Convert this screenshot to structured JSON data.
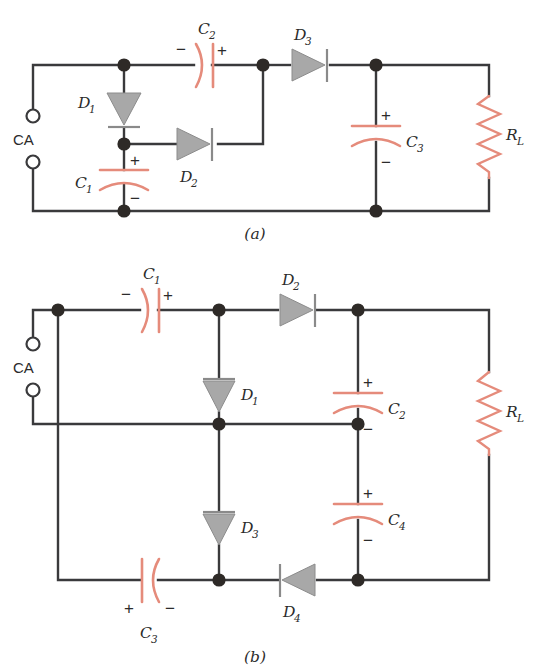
{
  "figure": {
    "colors": {
      "wire": "#3a3a3c",
      "component_red": "#e58b7b",
      "diode_gray": "#a8a8a8",
      "diode_stroke": "#6f6f6f",
      "node": "#2e2a27",
      "text": "#2b2b2b",
      "background": "#ffffff"
    },
    "captions": [
      {
        "id": "caption-a",
        "text": "(a)"
      },
      {
        "id": "caption-b",
        "text": "(b)"
      }
    ]
  },
  "circuit_a": {
    "caption": "(a)",
    "source_label": "CA",
    "components": [
      {
        "name": "D1",
        "type": "diode",
        "label": "D",
        "sub": "1",
        "orientation": "down",
        "bar": "bottom"
      },
      {
        "name": "D2",
        "type": "diode",
        "label": "D",
        "sub": "2",
        "orientation": "right",
        "bar": "right"
      },
      {
        "name": "D3",
        "type": "diode",
        "label": "D",
        "sub": "3",
        "orientation": "right",
        "bar": "right"
      },
      {
        "name": "C1",
        "type": "capacitor",
        "label": "C",
        "sub": "1",
        "orientation": "vertical",
        "plus": "top",
        "minus": "bottom"
      },
      {
        "name": "C2",
        "type": "capacitor",
        "label": "C",
        "sub": "2",
        "orientation": "horizontal",
        "plus": "right",
        "minus": "left"
      },
      {
        "name": "C3",
        "type": "capacitor",
        "label": "C",
        "sub": "3",
        "orientation": "vertical",
        "plus": "top",
        "minus": "bottom"
      },
      {
        "name": "RL",
        "type": "resistor",
        "label": "R",
        "sub": "L",
        "orientation": "vertical"
      }
    ],
    "polarity_marks": [
      {
        "id": "c2-minus",
        "text": "−"
      },
      {
        "id": "c2-plus",
        "text": "+"
      },
      {
        "id": "c1-plus",
        "text": "+"
      },
      {
        "id": "c1-minus",
        "text": "−"
      },
      {
        "id": "c3-plus",
        "text": "+"
      },
      {
        "id": "c3-minus",
        "text": "−"
      }
    ]
  },
  "circuit_b": {
    "caption": "(b)",
    "source_label": "CA",
    "components": [
      {
        "name": "C1",
        "type": "capacitor",
        "label": "C",
        "sub": "1",
        "orientation": "horizontal",
        "plus": "right",
        "minus": "left"
      },
      {
        "name": "D2",
        "type": "diode",
        "label": "D",
        "sub": "2",
        "orientation": "right",
        "bar": "right"
      },
      {
        "name": "D1",
        "type": "diode",
        "label": "D",
        "sub": "1",
        "orientation": "down",
        "bar": "top"
      },
      {
        "name": "C2",
        "type": "capacitor",
        "label": "C",
        "sub": "2",
        "orientation": "vertical",
        "plus": "top",
        "minus": "bottom"
      },
      {
        "name": "D3",
        "type": "diode",
        "label": "D",
        "sub": "3",
        "orientation": "down",
        "bar": "top"
      },
      {
        "name": "C4",
        "type": "capacitor",
        "label": "C",
        "sub": "4",
        "orientation": "vertical",
        "plus": "top",
        "minus": "bottom"
      },
      {
        "name": "C3",
        "type": "capacitor",
        "label": "C",
        "sub": "3",
        "orientation": "horizontal",
        "plus": "left",
        "minus": "right"
      },
      {
        "name": "D4",
        "type": "diode",
        "label": "D",
        "sub": "4",
        "orientation": "left",
        "bar": "left"
      },
      {
        "name": "RL",
        "type": "resistor",
        "label": "R",
        "sub": "L",
        "orientation": "vertical"
      }
    ],
    "polarity_marks": [
      {
        "id": "c1b-minus",
        "text": "−"
      },
      {
        "id": "c1b-plus",
        "text": "+"
      },
      {
        "id": "c2b-plus",
        "text": "+"
      },
      {
        "id": "c2b-minus",
        "text": "−"
      },
      {
        "id": "c4b-plus",
        "text": "+"
      },
      {
        "id": "c4b-minus",
        "text": "−"
      },
      {
        "id": "c3b-plus",
        "text": "+"
      },
      {
        "id": "c3b-minus",
        "text": "−"
      }
    ]
  }
}
